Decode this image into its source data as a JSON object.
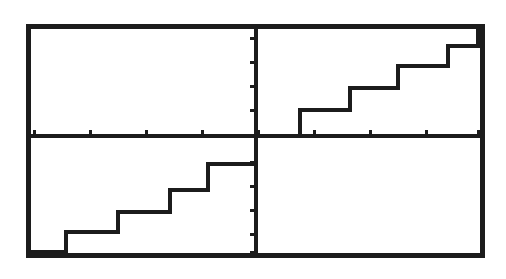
{
  "document": {
    "kind": "graphing-calculator-screen-capture",
    "background_color": "#ffffff",
    "ink_color": "#1a1a1a"
  },
  "screen": {
    "frame": {
      "label": "calculator-viewport-border",
      "left": 26,
      "top": 24,
      "right": 485,
      "bottom": 258,
      "border_width": 5,
      "color": "#1c1c1c"
    },
    "plot_background_color": "#ffffff"
  },
  "axes": {
    "x_axis": {
      "label": "x-axis",
      "pixel_y": 136,
      "color": "#1c1c1c",
      "thickness": 4,
      "tick_length": 6,
      "tick_pixels": [
        34,
        90,
        146,
        202,
        258,
        314,
        370,
        426,
        478
      ],
      "tick_values": [
        -8,
        -6,
        -4,
        -2,
        0,
        2,
        4,
        6,
        8
      ]
    },
    "y_axis": {
      "label": "y-axis",
      "pixel_x": 256,
      "color": "#1c1c1c",
      "thickness": 4,
      "tick_length": 6,
      "tick_pixels": [
        38,
        62,
        86,
        110,
        136,
        162,
        186,
        210,
        234,
        252
      ],
      "tick_values": [
        4,
        3,
        2,
        1,
        0,
        -1,
        -2,
        -3,
        -4,
        -5
      ]
    },
    "origin": {
      "pixel_x": 256,
      "pixel_y": 136
    }
  },
  "chart_data": {
    "type": "line",
    "title": "",
    "subtitle": "",
    "xlabel": "",
    "ylabel": "",
    "grid": false,
    "legend": null,
    "legend_position": "none",
    "xlim": [
      -8.5,
      8.5
    ],
    "ylim": [
      -4.8,
      4.6
    ],
    "curve_color": "#1c1c1c",
    "curve_width": 4,
    "series": [
      {
        "name": "step-function",
        "style": "staircase",
        "steps_pixels": [
          {
            "x_start": 30,
            "x_end": 66,
            "y": 252
          },
          {
            "x_start": 66,
            "x_end": 118,
            "y": 232
          },
          {
            "x_start": 118,
            "x_end": 170,
            "y": 212
          },
          {
            "x_start": 170,
            "x_end": 208,
            "y": 190
          },
          {
            "x_start": 208,
            "x_end": 256,
            "y": 164
          },
          {
            "x_start": 256,
            "x_end": 300,
            "y": 136
          },
          {
            "x_start": 300,
            "x_end": 350,
            "y": 110
          },
          {
            "x_start": 350,
            "x_end": 398,
            "y": 88
          },
          {
            "x_start": 398,
            "x_end": 448,
            "y": 66
          },
          {
            "x_start": 448,
            "x_end": 478,
            "y": 46
          },
          {
            "x_start": 478,
            "x_end": 481,
            "y": 30
          }
        ],
        "steps_data": [
          {
            "x_start": -8.1,
            "x_end": -6.8,
            "y": -4.2
          },
          {
            "x_start": -6.8,
            "x_end": -4.9,
            "y": -3.4
          },
          {
            "x_start": -4.9,
            "x_end": -3.1,
            "y": -2.7
          },
          {
            "x_start": -3.1,
            "x_end": -1.7,
            "y": -1.9
          },
          {
            "x_start": -1.7,
            "x_end": 0.0,
            "y": -1.0
          },
          {
            "x_start": 0.0,
            "x_end": 1.6,
            "y": 0.0
          },
          {
            "x_start": 1.6,
            "x_end": 3.4,
            "y": 0.95
          },
          {
            "x_start": 3.4,
            "x_end": 5.1,
            "y": 1.75
          },
          {
            "x_start": 5.1,
            "x_end": 6.9,
            "y": 2.55
          },
          {
            "x_start": 6.9,
            "x_end": 8.0,
            "y": 3.3
          },
          {
            "x_start": 8.0,
            "x_end": 8.1,
            "y": 3.9
          }
        ]
      }
    ]
  }
}
